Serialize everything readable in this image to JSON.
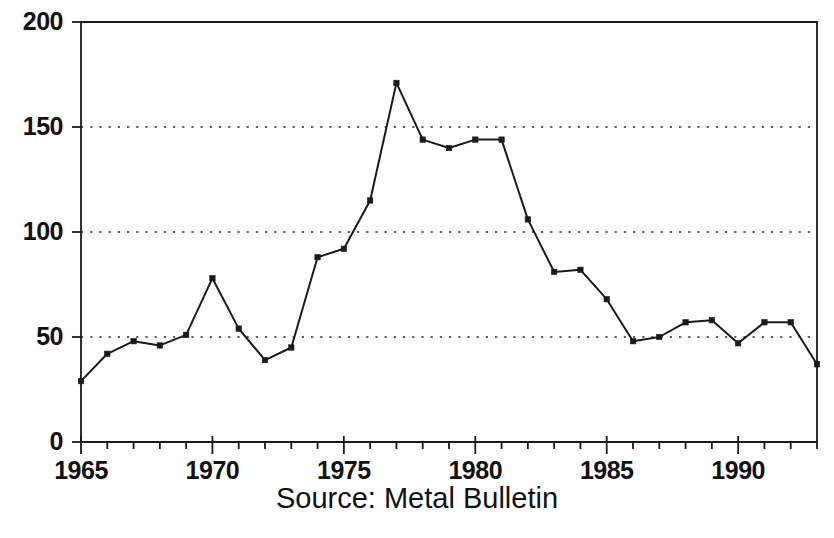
{
  "caption": {
    "source_text": "Source: Metal Bulletin"
  },
  "axis": {
    "y_ticks": [
      "0",
      "50",
      "100",
      "150",
      "200"
    ],
    "x_ticks": [
      "1965",
      "1970",
      "1975",
      "1980",
      "1985",
      "1990"
    ]
  },
  "colors": {
    "line": "#1a1a1a",
    "marker": "#1a1a1a",
    "grid": "#2b2b2b",
    "axis": "#1a1a1a",
    "text": "#111111",
    "background": "#ffffff"
  },
  "chart_data": {
    "type": "line",
    "title": "",
    "subtitle": "",
    "xlabel": "",
    "ylabel": "",
    "xlim": [
      1965,
      1993
    ],
    "ylim": [
      0,
      200
    ],
    "y_ticks": [
      0,
      50,
      100,
      150,
      200
    ],
    "x_ticks": [
      1965,
      1970,
      1975,
      1980,
      1985,
      1990
    ],
    "x_minor_tick_interval": 1,
    "grid": "horizontal dotted at 50, 100, 150",
    "legend": null,
    "legend_position": "none",
    "annotations": [
      "Source: Metal Bulletin"
    ],
    "marker": "square",
    "x": [
      1965,
      1966,
      1967,
      1968,
      1969,
      1970,
      1971,
      1972,
      1973,
      1974,
      1975,
      1976,
      1977,
      1978,
      1979,
      1980,
      1981,
      1982,
      1983,
      1984,
      1985,
      1986,
      1987,
      1988,
      1989,
      1990,
      1991,
      1992,
      1993
    ],
    "values": [
      29,
      42,
      48,
      46,
      51,
      78,
      54,
      39,
      45,
      88,
      92,
      115,
      171,
      144,
      140,
      144,
      144,
      106,
      81,
      82,
      68,
      48,
      50,
      57,
      58,
      47,
      57,
      57,
      37
    ],
    "series": [
      {
        "name": "",
        "values": [
          29,
          42,
          48,
          46,
          51,
          78,
          54,
          39,
          45,
          88,
          92,
          115,
          171,
          144,
          140,
          144,
          144,
          106,
          81,
          82,
          68,
          48,
          50,
          57,
          58,
          47,
          57,
          57,
          37
        ]
      }
    ]
  }
}
